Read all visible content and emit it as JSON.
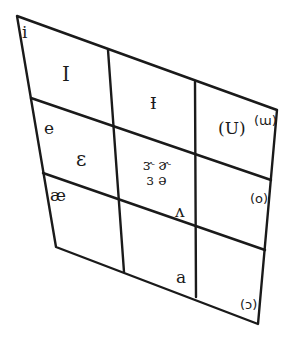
{
  "diagram": {
    "type": "vowel-quadrilateral",
    "line_color": "#1a1a1a",
    "background": "#ffffff",
    "outline": {
      "top_left": [
        17,
        16
      ],
      "top_right": [
        277,
        110
      ],
      "bottom_right": [
        258,
        324
      ],
      "bottom_left": [
        56,
        247
      ]
    },
    "rows": 3,
    "columns": 3,
    "symbols": {
      "i": "i",
      "I": "I",
      "barred_i": "Ɨ",
      "u_paren": "(U)",
      "w_paren": "(ɯ)",
      "e": "e",
      "epsilon": "ɛ",
      "central_rhotic_1": "ɝ ɚ",
      "central_rhotic_2": "ɜ ə",
      "o_paren": "(o)",
      "ae": "æ",
      "wedge": "ʌ",
      "a": "a",
      "open_o_paren": "(ɔ)"
    }
  }
}
